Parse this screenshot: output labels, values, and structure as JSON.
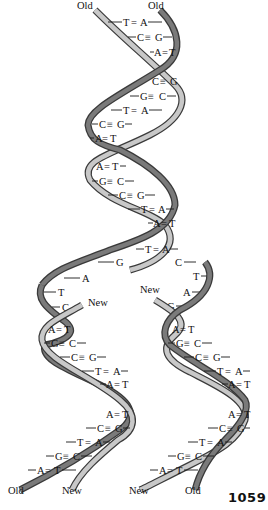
{
  "figure": {
    "page_number": "1059",
    "colors": {
      "strand_outline": "#3a3a3a",
      "strand_dark_fill": "#7a7a7a",
      "strand_light_fill": "#c8c8c8",
      "text": "#111111",
      "background": "#ffffff"
    },
    "labels": {
      "top_left": "Old",
      "top_right": "Old",
      "fork_new_left": "New",
      "fork_new_right": "New",
      "bottom_1": "Old",
      "bottom_2": "New",
      "bottom_3": "New",
      "bottom_4": "Old"
    },
    "parent_helix": {
      "base_pairs": [
        {
          "left": "T",
          "bond": "=",
          "right": "A"
        },
        {
          "left": "C",
          "bond": "≡",
          "right": "G"
        },
        {
          "left": "A",
          "bond": "=",
          "right": "T"
        },
        {
          "left": "C",
          "bond": "≡",
          "right": "G"
        },
        {
          "left": "G",
          "bond": "≡",
          "right": "C"
        },
        {
          "left": "T",
          "bond": "=",
          "right": "A"
        },
        {
          "left": "C",
          "bond": "≡",
          "right": "G"
        },
        {
          "left": "A",
          "bond": "=",
          "right": "T"
        },
        {
          "left": "A",
          "bond": "=",
          "right": "T"
        },
        {
          "left": "G",
          "bond": "≡",
          "right": "C"
        },
        {
          "left": "C",
          "bond": "≡",
          "right": "G"
        },
        {
          "left": "T",
          "bond": "=",
          "right": "A"
        },
        {
          "left": "A",
          "bond": "=",
          "right": "T"
        },
        {
          "left": "T",
          "bond": "=",
          "right": "A"
        }
      ]
    },
    "fork": {
      "left_unpaired": [
        "G",
        "A",
        "T",
        "C"
      ],
      "right_unpaired": [
        "C",
        "T",
        "A",
        "G"
      ]
    },
    "daughter_left": {
      "base_pairs": [
        {
          "left": "A",
          "bond": "=",
          "right": "T"
        },
        {
          "left": "G",
          "bond": "≡",
          "right": "C"
        },
        {
          "left": "C",
          "bond": "≡",
          "right": "G"
        },
        {
          "left": "T",
          "bond": "=",
          "right": "A"
        },
        {
          "left": "A",
          "bond": "=",
          "right": "T"
        },
        {
          "left": "A",
          "bond": "=",
          "right": "T"
        },
        {
          "left": "C",
          "bond": "≡",
          "right": "G"
        },
        {
          "left": "T",
          "bond": "=",
          "right": "A"
        },
        {
          "left": "G",
          "bond": "≡",
          "right": "C"
        },
        {
          "left": "A",
          "bond": "=",
          "right": "T"
        }
      ]
    },
    "daughter_right": {
      "base_pairs": [
        {
          "left": "A",
          "bond": "=",
          "right": "T"
        },
        {
          "left": "G",
          "bond": "≡",
          "right": "C"
        },
        {
          "left": "C",
          "bond": "≡",
          "right": "G"
        },
        {
          "left": "T",
          "bond": "=",
          "right": "A"
        },
        {
          "left": "A",
          "bond": "=",
          "right": "T"
        },
        {
          "left": "A",
          "bond": "=",
          "right": "T"
        },
        {
          "left": "C",
          "bond": "≡",
          "right": "G"
        },
        {
          "left": "T",
          "bond": "=",
          "right": "A"
        },
        {
          "left": "G",
          "bond": "≡",
          "right": "C"
        },
        {
          "left": "A",
          "bond": "=",
          "right": "T"
        }
      ]
    }
  }
}
